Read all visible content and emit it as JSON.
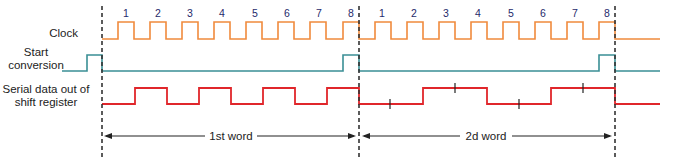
{
  "labels": {
    "clock": "Clock",
    "start_line1": "Start",
    "start_line2": "conversion",
    "serial_line1": "Serial data out of",
    "serial_line2": "shift register"
  },
  "clock_numbers": {
    "word1": [
      "1",
      "2",
      "3",
      "4",
      "5",
      "6",
      "7",
      "8"
    ],
    "word2": [
      "1",
      "2",
      "3",
      "4",
      "5",
      "6",
      "7",
      "8"
    ]
  },
  "words": {
    "first": "1st word",
    "second": "2d word"
  },
  "colors": {
    "clock": "#f08a3c",
    "start_conversion": "#3a8f95",
    "serial_data": "#e0262b",
    "markers": "#222222",
    "numbers": "#1f2a6b"
  },
  "serial_bits": {
    "word1": [
      0,
      1,
      0,
      1,
      0,
      1,
      0,
      1
    ],
    "word2": [
      0,
      0,
      1,
      1,
      0,
      0,
      1,
      1
    ]
  }
}
